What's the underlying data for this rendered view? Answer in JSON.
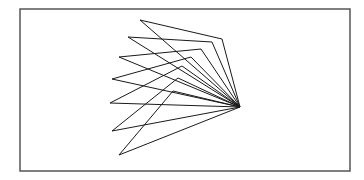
{
  "diagram": {
    "frame": {
      "x": 20,
      "y": 9,
      "width": 330,
      "height": 162,
      "stroke": "#555555"
    },
    "apex": {
      "x": 240,
      "y": 107
    },
    "stroke": "#1a1a1a",
    "triangles": [
      {
        "left": {
          "x": 140,
          "y": 20
        },
        "inner": {
          "x": 222,
          "y": 39
        }
      },
      {
        "left": {
          "x": 128,
          "y": 37
        },
        "inner": {
          "x": 212,
          "y": 42
        }
      },
      {
        "left": {
          "x": 119,
          "y": 57
        },
        "inner": {
          "x": 201,
          "y": 49
        }
      },
      {
        "left": {
          "x": 112,
          "y": 79
        },
        "inner": {
          "x": 191,
          "y": 57
        }
      },
      {
        "left": {
          "x": 110,
          "y": 103
        },
        "inner": {
          "x": 182,
          "y": 66
        }
      },
      {
        "left": {
          "x": 112,
          "y": 131
        },
        "inner": {
          "x": 178,
          "y": 78
        }
      },
      {
        "left": {
          "x": 119,
          "y": 155
        },
        "inner": {
          "x": 173,
          "y": 91
        }
      }
    ]
  }
}
